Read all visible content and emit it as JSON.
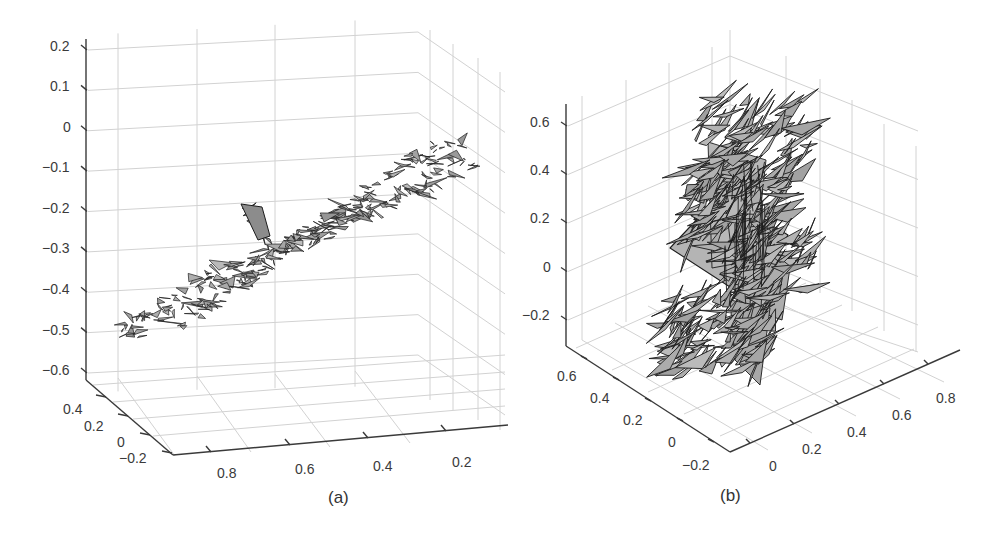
{
  "chart_data": [
    {
      "id": "a",
      "type": "surface3d",
      "caption": "(a)",
      "description": "3D triangulated mesh surface of an elongated object (grey faces, black edges) viewed in perspective; oriented diagonally from lower-left to upper-right with a small protrusion near the middle",
      "zlabel": "",
      "xlabel": "",
      "ylabel": "",
      "z_ticks": [
        "0.2",
        "0.1",
        "0",
        "-0.1",
        "-0.2",
        "-0.3",
        "-0.4",
        "-0.5",
        "-0.6"
      ],
      "z_tick_values": [
        0.2,
        0.1,
        0,
        -0.1,
        -0.2,
        -0.3,
        -0.4,
        -0.5,
        -0.6
      ],
      "y_ticks": [
        "0.4",
        "0.2",
        "0",
        "-0.2"
      ],
      "y_tick_values": [
        0.4,
        0.2,
        0,
        -0.2
      ],
      "x_ticks": [
        "0.8",
        "0.6",
        "0.4",
        "0.2"
      ],
      "x_tick_values": [
        0.8,
        0.6,
        0.4,
        0.2
      ],
      "zlim": [
        -0.6,
        0.2
      ],
      "ylim": [
        -0.2,
        0.4
      ],
      "xlim": [
        0.2,
        0.8
      ],
      "grid": true,
      "face_color": "#a9a9a9",
      "edge_color": "#1a1a1a"
    },
    {
      "id": "b",
      "type": "surface3d",
      "caption": "(b)",
      "description": "3D scatter of large, jagged, overlapping grey triangles with black edges forming a noisy vertical cluster",
      "zlabel": "",
      "xlabel": "",
      "ylabel": "",
      "z_ticks": [
        "0.6",
        "0.4",
        "0.2",
        "0",
        "-0.2"
      ],
      "z_tick_values": [
        0.6,
        0.4,
        0.2,
        0,
        -0.2
      ],
      "y_ticks": [
        "0.6",
        "0.4",
        "0.2",
        "0",
        "-0.2"
      ],
      "y_tick_values": [
        0.6,
        0.4,
        0.2,
        0,
        -0.2
      ],
      "x_ticks": [
        "0",
        "0.2",
        "0.4",
        "0.6",
        "0.8"
      ],
      "x_tick_values": [
        0,
        0.2,
        0.4,
        0.6,
        0.8
      ],
      "zlim": [
        -0.2,
        0.6
      ],
      "ylim": [
        -0.2,
        0.6
      ],
      "xlim": [
        0,
        0.8
      ],
      "grid": true,
      "face_color": "#b0b0b0",
      "edge_color": "#1a1a1a"
    }
  ],
  "panel_a": {
    "caption": "(a)",
    "z_labels": [
      "0.2",
      "0.1",
      "0",
      "−0.1",
      "−0.2",
      "−0.3",
      "−0.4",
      "−0.5",
      "−0.6"
    ],
    "y_labels": [
      "0.4",
      "0.2",
      "0",
      "−0.2"
    ],
    "x_labels": [
      "0.8",
      "0.6",
      "0.4",
      "0.2"
    ]
  },
  "panel_b": {
    "caption": "(b)",
    "z_labels": [
      "0.6",
      "0.4",
      "0.2",
      "0",
      "−0.2"
    ],
    "y_labels": [
      "0.6",
      "0.4",
      "0.2",
      "0",
      "−0.2"
    ],
    "x_labels": [
      "0",
      "0.2",
      "0.4",
      "0.6",
      "0.8"
    ]
  },
  "colors": {
    "axis": "#3a3a3a",
    "grid": "#d2d2d2",
    "face": "#a8a8a8",
    "edge": "#1c1c1c"
  }
}
